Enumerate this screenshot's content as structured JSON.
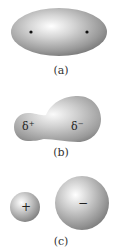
{
  "panels": [
    {
      "id": "a",
      "label": "(a)",
      "shape": "ellipsoid",
      "markers": [
        "nucleus-dot",
        "nucleus-dot"
      ]
    },
    {
      "id": "b",
      "label": "(b)",
      "shape": "distorted-dumbbell",
      "charges": {
        "small_lobe": {
          "symbol": "δ",
          "sign": "+"
        },
        "large_lobe": {
          "symbol": "δ",
          "sign": "−"
        }
      }
    },
    {
      "id": "c",
      "label": "(c)",
      "shape": "two-spheres",
      "charges": {
        "small_sphere": "+",
        "large_sphere": "−"
      }
    }
  ],
  "colors": {
    "highlight": "#ffffff",
    "mid_gray": "#b4b4b4",
    "dark_gray": "#6e6e6e",
    "dot": "#111111",
    "text": "#333333"
  }
}
